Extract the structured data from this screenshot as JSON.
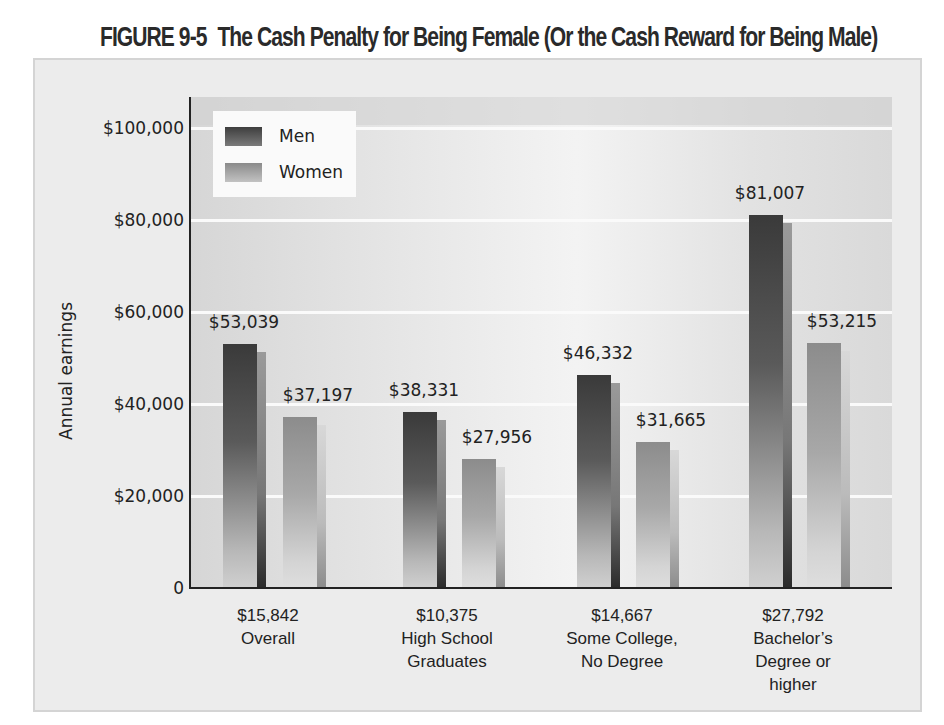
{
  "figure": {
    "number": "FIGURE 9-5",
    "title": "The Cash Penalty for Being Female (Or the Cash Reward for Being Male)"
  },
  "legend": [
    {
      "label": "Men",
      "color": "#4a4a4a"
    },
    {
      "label": "Women",
      "color": "#a6a6a6"
    }
  ],
  "axis": {
    "ylabel": "Annual earnings",
    "yticks": [
      "0",
      "$20,000",
      "$40,000",
      "$60,000",
      "$80,000",
      "$100,000"
    ]
  },
  "chart_data": {
    "type": "bar",
    "title": "The Cash Penalty for Being Female (Or the Cash Reward for Being Male)",
    "xlabel": "",
    "ylabel": "Annual earnings",
    "ylim": [
      0,
      105000
    ],
    "yticks": [
      0,
      20000,
      40000,
      60000,
      80000,
      100000
    ],
    "grid": true,
    "legend_position": "top-left inside",
    "categories": [
      "Overall",
      "High School Graduates",
      "Some College, No Degree",
      "Bachelor's Degree or higher"
    ],
    "series": [
      {
        "name": "Men",
        "values": [
          53039,
          38331,
          46332,
          81007
        ]
      },
      {
        "name": "Women",
        "values": [
          37197,
          27956,
          31665,
          53215
        ]
      }
    ],
    "gap_labels": [
      15842,
      10375,
      14667,
      27792
    ],
    "annotations": "Below each category: difference between men's and women's earnings"
  },
  "bars": [
    {
      "men": "$53,039",
      "women": "$37,197",
      "gap": "$15,842",
      "cat_line1": "Overall",
      "cat_line2": "",
      "cat_line3": ""
    },
    {
      "men": "$38,331",
      "women": "$27,956",
      "gap": "$10,375",
      "cat_line1": "High School",
      "cat_line2": "Graduates",
      "cat_line3": ""
    },
    {
      "men": "$46,332",
      "women": "$31,665",
      "gap": "$14,667",
      "cat_line1": "Some College,",
      "cat_line2": "No Degree",
      "cat_line3": ""
    },
    {
      "men": "$81,007",
      "women": "$53,215",
      "gap": "$27,792",
      "cat_line1": "Bachelor’s",
      "cat_line2": "Degree or",
      "cat_line3": "higher"
    }
  ]
}
